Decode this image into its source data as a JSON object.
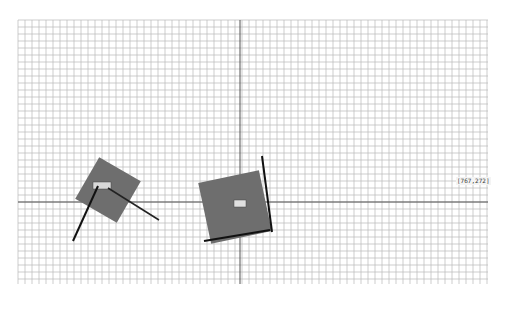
{
  "canvas": {
    "width": 506,
    "height": 310,
    "background": "#ffffff",
    "grid": {
      "left": 18,
      "top": 20,
      "right": 488,
      "bottom": 284,
      "cell": 7,
      "line_color": "#b8b8b8",
      "axis_color": "#555555",
      "axis_x": 240,
      "axis_y": 202
    }
  },
  "shapes": [
    {
      "id": "small-square",
      "center": [
        108,
        190
      ],
      "size": 48,
      "rotation_deg": 30,
      "fill": "#6e6e6e",
      "lines": [
        {
          "from": [
            98,
            186
          ],
          "to": [
            73,
            241
          ],
          "color": "#111111",
          "width": 2
        },
        {
          "from": [
            108,
            188
          ],
          "to": [
            159,
            220
          ],
          "color": "#222222",
          "width": 1.5
        }
      ],
      "badge": {
        "x": 93,
        "y": 182,
        "w": 18,
        "h": 7,
        "fill": "#d8d8d8"
      }
    },
    {
      "id": "large-square",
      "center": [
        235,
        207
      ],
      "size": 62,
      "rotation_deg": -12,
      "fill": "#6e6e6e",
      "lines": [
        {
          "from": [
            262,
            156
          ],
          "to": [
            272,
            232
          ],
          "color": "#111111",
          "width": 2
        },
        {
          "from": [
            204,
            241
          ],
          "to": [
            270,
            230
          ],
          "color": "#111111",
          "width": 2
        }
      ],
      "badge": {
        "x": 234,
        "y": 200,
        "w": 12,
        "h": 7,
        "fill": "#e0e0e0"
      }
    }
  ],
  "cursor_label": {
    "text": "[767,272]",
    "x": 456,
    "y": 177
  }
}
